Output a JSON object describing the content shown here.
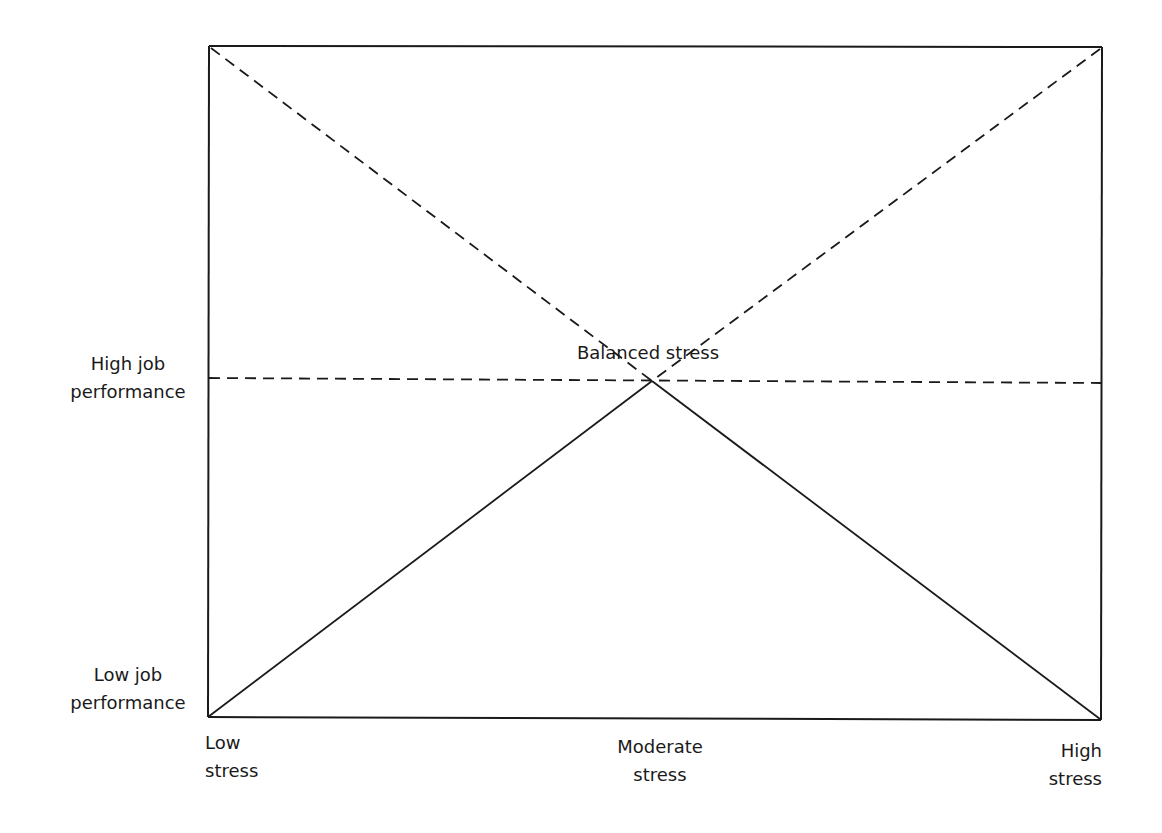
{
  "diagram": {
    "type": "stress-performance curve",
    "frame": {
      "x1": 209,
      "y1": 46,
      "x2": 1101,
      "y2": 719
    },
    "peak": {
      "x": 652,
      "y": 381
    },
    "colors": {
      "line": "#1a1a1a",
      "background": "#ffffff"
    },
    "peak_label": "Balanced stress",
    "y_labels": {
      "high": [
        "High job",
        "performance"
      ],
      "low": [
        "Low job",
        "performance"
      ]
    },
    "x_labels": {
      "low": [
        "Low",
        "stress"
      ],
      "moderate": [
        "Moderate",
        "stress"
      ],
      "high": [
        "High",
        "stress"
      ]
    }
  }
}
